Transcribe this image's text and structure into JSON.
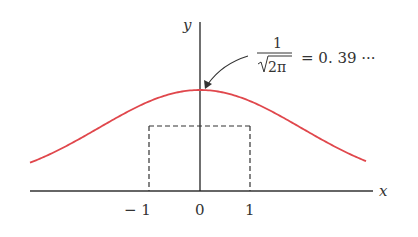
{
  "chart_data": {
    "type": "line",
    "title": "",
    "xlabel": "x",
    "ylabel": "y",
    "x_ticks": [
      "-1",
      "0",
      "1"
    ],
    "series": [
      {
        "name": "standard normal density",
        "function": "y = (1/sqrt(2*pi)) * exp(-x^2/2)",
        "color": "#e0474c"
      }
    ],
    "annotations": [
      {
        "text": "1/√(2π) = 0.39 ···",
        "points_to": "peak at x = 0",
        "value": 0.39
      }
    ],
    "guides": [
      {
        "type": "dashed",
        "description": "verticals at x=-1 and x=1 up to curve, horizontal connecting them",
        "y_value": 0.242
      }
    ],
    "xlim": [
      -3.4,
      3.4
    ],
    "grid": false
  },
  "labels": {
    "x_axis": "x",
    "y_axis": "y",
    "tick_neg1": "− 1",
    "tick_0": "0",
    "tick_1": "1",
    "annot_num": "1",
    "annot_den": "2π",
    "annot_rest": "= 0. 39 ···"
  },
  "colors": {
    "curve": "#e0474c",
    "axis": "#333333"
  }
}
